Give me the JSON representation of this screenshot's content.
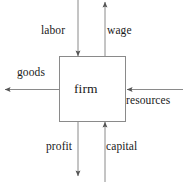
{
  "diagram": {
    "background_color": "#ffffff",
    "line_color": "#808080",
    "text_color": "#1a1a1a",
    "center_node": {
      "label": "firm",
      "box": {
        "x": 59,
        "y": 56,
        "width": 67,
        "height": 66
      }
    },
    "flows": [
      {
        "label": "labor",
        "direction": "down",
        "into_node": true,
        "side": "top",
        "axis": "vertical",
        "x": 78
      },
      {
        "label": "wage",
        "direction": "up",
        "into_node": false,
        "side": "top",
        "axis": "vertical",
        "x": 105
      },
      {
        "label": "goods",
        "direction": "left",
        "into_node": false,
        "side": "left",
        "axis": "horizontal",
        "y": 89
      },
      {
        "label": "resources",
        "direction": "left",
        "into_node": true,
        "side": "right",
        "axis": "horizontal",
        "y": 89
      },
      {
        "label": "profit",
        "direction": "down",
        "into_node": false,
        "side": "bottom",
        "axis": "vertical",
        "x": 78
      },
      {
        "label": "capital",
        "direction": "up",
        "into_node": true,
        "side": "bottom",
        "axis": "vertical",
        "x": 105
      }
    ]
  }
}
